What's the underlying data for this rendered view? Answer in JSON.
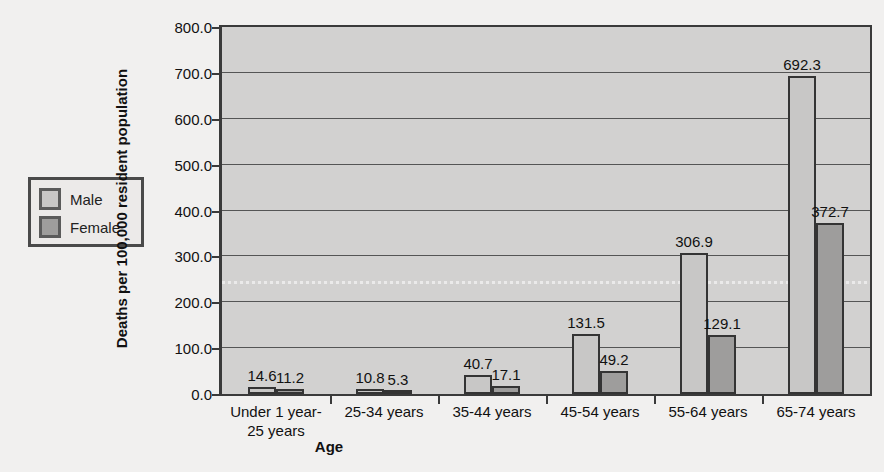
{
  "chart_data": {
    "type": "bar",
    "title": "",
    "xlabel": "Age",
    "ylabel": "Deaths per 100,000 resident population",
    "categories": [
      "Under 1 year-\n25 years",
      "25-34 years",
      "35-44 years",
      "45-54 years",
      "55-64 years",
      "65-74 years"
    ],
    "series": [
      {
        "name": "Male",
        "color": "#c8c7c6",
        "values": [
          14.6,
          10.8,
          40.7,
          131.5,
          306.9,
          692.3
        ]
      },
      {
        "name": "Female",
        "color": "#9e9d9c",
        "values": [
          11.2,
          5.3,
          17.1,
          49.2,
          129.1,
          372.7
        ]
      }
    ],
    "ylim": [
      0.0,
      800.0
    ],
    "yticks": [
      "0.0",
      "100.0",
      "200.0",
      "300.0",
      "400.0",
      "500.0",
      "600.0",
      "700.0",
      "800.0"
    ],
    "ytick_values": [
      0,
      100,
      200,
      300,
      400,
      500,
      600,
      700,
      800
    ],
    "grid": true,
    "legend_position": "left-outside",
    "plot_background": "#d2d1d0",
    "figure_background": "#f1f0ef"
  },
  "legend": {
    "items": [
      {
        "label": "Male"
      },
      {
        "label": "Female"
      }
    ]
  }
}
